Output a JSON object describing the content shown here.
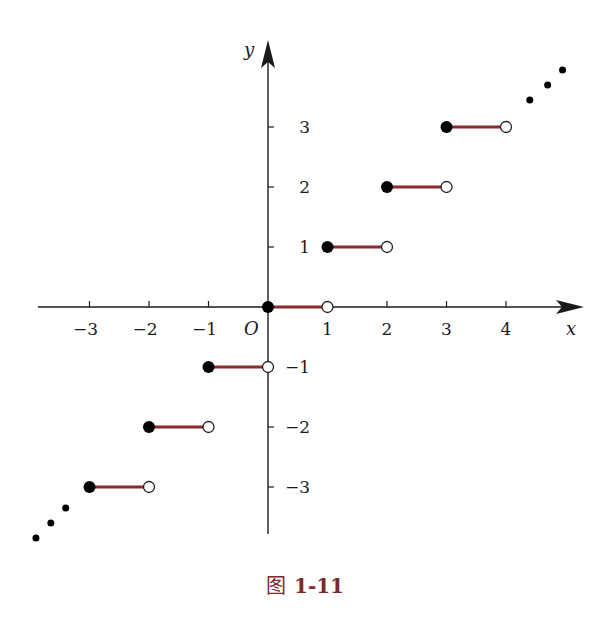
{
  "chart_data": {
    "type": "step",
    "title": "",
    "xlabel": "x",
    "ylabel": "y",
    "origin_label": "O",
    "xlim": [
      -3.8,
      5.2
    ],
    "ylim": [
      -3.8,
      4.4
    ],
    "x_ticks": [
      -3,
      -2,
      -1,
      1,
      2,
      3,
      4
    ],
    "x_tick_labels": [
      "−3",
      "−2",
      "−1",
      "1",
      "2",
      "3",
      "4"
    ],
    "y_ticks": [
      -3,
      -2,
      -1,
      1,
      2,
      3
    ],
    "y_tick_labels": [
      "−3",
      "−2",
      "−1",
      "1",
      "2",
      "3"
    ],
    "grid": false,
    "segments": [
      {
        "x_start": -3,
        "x_end": -2,
        "y": -3,
        "start": "closed",
        "end": "open"
      },
      {
        "x_start": -2,
        "x_end": -1,
        "y": -2,
        "start": "closed",
        "end": "open"
      },
      {
        "x_start": -1,
        "x_end": 0,
        "y": -1,
        "start": "closed",
        "end": "open"
      },
      {
        "x_start": 0,
        "x_end": 1,
        "y": 0,
        "start": "closed",
        "end": "open"
      },
      {
        "x_start": 1,
        "x_end": 2,
        "y": 1,
        "start": "closed",
        "end": "open"
      },
      {
        "x_start": 2,
        "x_end": 3,
        "y": 2,
        "start": "closed",
        "end": "open"
      },
      {
        "x_start": 3,
        "x_end": 4,
        "y": 3,
        "start": "closed",
        "end": "open"
      }
    ],
    "continuation_dots": {
      "upper_right": [
        [
          4.4,
          3.45
        ],
        [
          4.7,
          3.7
        ],
        [
          4.95,
          3.95
        ]
      ],
      "lower_left": [
        [
          -3.4,
          -3.35
        ],
        [
          -3.65,
          -3.6
        ],
        [
          -3.9,
          -3.85
        ]
      ]
    },
    "segment_color": "#8b2a2a",
    "axis_color": "#1a1a1a"
  },
  "figure": {
    "caption_glyph": "图",
    "caption_number": "1-11"
  }
}
